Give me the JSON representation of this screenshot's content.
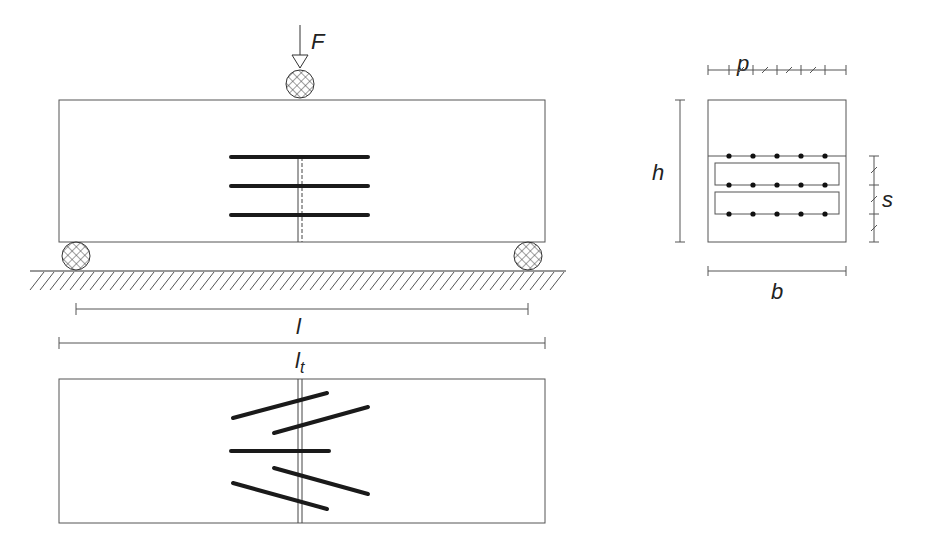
{
  "labels": {
    "force": "F",
    "span": "l",
    "total_length": "l",
    "total_length_sub": "t",
    "height": "h",
    "width": "b",
    "lateral_spacing": "p",
    "vertical_spacing": "s"
  },
  "colors": {
    "line": "#555555",
    "rebar": "#1a1a1a",
    "background": "#ffffff"
  },
  "elevation": {
    "beam": {
      "x": 59,
      "y": 100,
      "w": 486,
      "h": 142
    },
    "rebar_rows": 3,
    "crack_x": 300
  },
  "plan": {
    "beam": {
      "x": 59,
      "y": 379,
      "w": 486,
      "h": 144
    },
    "bars": 5
  },
  "section": {
    "outline": {
      "x": 708,
      "y": 100,
      "w": 138,
      "h": 142
    },
    "layers": 3,
    "bars_per_layer": 5
  }
}
